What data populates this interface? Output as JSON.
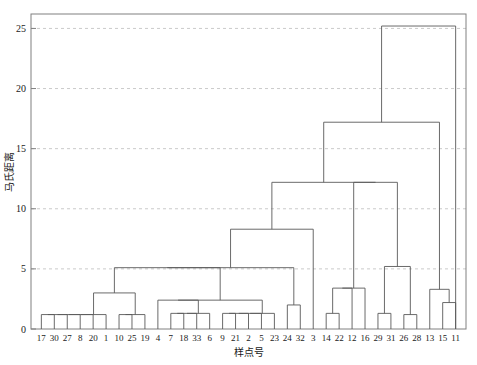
{
  "chart_data": {
    "type": "dendrogram",
    "title": "",
    "xlabel": "样点号",
    "ylabel": "马氏距离",
    "ylim": [
      0,
      26.2
    ],
    "yticks": [
      0,
      5,
      10,
      15,
      20,
      25
    ],
    "ytick_labels": [
      "0",
      "5",
      "10",
      "15",
      "20",
      "25"
    ],
    "grid": "horizontal-dashed",
    "legend": "none",
    "line_color": "#595959",
    "grid_color": "#bdbdbd",
    "axis_color": "#808080",
    "leaf_order": [
      "17",
      "30",
      "27",
      "8",
      "20",
      "1",
      "10",
      "25",
      "19",
      "4",
      "7",
      "18",
      "33",
      "6",
      "9",
      "21",
      "2",
      "5",
      "23",
      "24",
      "32",
      "3",
      "14",
      "22",
      "12",
      "16",
      "29",
      "31",
      "26",
      "28",
      "13",
      "15",
      "11"
    ],
    "n_leaves": 33,
    "links": [
      {
        "id": "L1",
        "left": {
          "leaf": "17"
        },
        "right": {
          "leaf": "30"
        },
        "height": 1.2
      },
      {
        "id": "L2",
        "left": {
          "node": "L1"
        },
        "right": {
          "leaf": "27"
        },
        "height": 1.2
      },
      {
        "id": "L3",
        "left": {
          "node": "L2"
        },
        "right": {
          "leaf": "8"
        },
        "height": 1.2
      },
      {
        "id": "L4",
        "left": {
          "node": "L3"
        },
        "right": {
          "leaf": "20"
        },
        "height": 1.2
      },
      {
        "id": "L5",
        "left": {
          "node": "L4"
        },
        "right": {
          "leaf": "1"
        },
        "height": 1.2
      },
      {
        "id": "L6",
        "left": {
          "leaf": "10"
        },
        "right": {
          "leaf": "25"
        },
        "height": 1.2
      },
      {
        "id": "L7",
        "left": {
          "node": "L6"
        },
        "right": {
          "leaf": "19"
        },
        "height": 1.2
      },
      {
        "id": "L8",
        "left": {
          "node": "L5"
        },
        "right": {
          "node": "L7"
        },
        "height": 3.0
      },
      {
        "id": "L9",
        "left": {
          "leaf": "7"
        },
        "right": {
          "leaf": "18"
        },
        "height": 1.3
      },
      {
        "id": "L10",
        "left": {
          "node": "L9"
        },
        "right": {
          "leaf": "33"
        },
        "height": 1.3
      },
      {
        "id": "L11",
        "left": {
          "node": "L10"
        },
        "right": {
          "leaf": "6"
        },
        "height": 1.3
      },
      {
        "id": "L12",
        "left": {
          "leaf": "4"
        },
        "right": {
          "node": "L11"
        },
        "height": 2.4
      },
      {
        "id": "L13",
        "left": {
          "leaf": "9"
        },
        "right": {
          "leaf": "21"
        },
        "height": 1.3
      },
      {
        "id": "L14",
        "left": {
          "node": "L13"
        },
        "right": {
          "leaf": "2"
        },
        "height": 1.3
      },
      {
        "id": "L15",
        "left": {
          "node": "L14"
        },
        "right": {
          "leaf": "5"
        },
        "height": 1.3
      },
      {
        "id": "L16",
        "left": {
          "node": "L15"
        },
        "right": {
          "leaf": "23"
        },
        "height": 1.3
      },
      {
        "id": "L17",
        "left": {
          "node": "L12"
        },
        "right": {
          "node": "L16"
        },
        "height": 2.4
      },
      {
        "id": "L18",
        "left": {
          "node": "L8"
        },
        "right": {
          "node": "L17"
        },
        "height": 5.1
      },
      {
        "id": "L19",
        "left": {
          "leaf": "24"
        },
        "right": {
          "leaf": "32"
        },
        "height": 2.0
      },
      {
        "id": "L20",
        "left": {
          "node": "L18"
        },
        "right": {
          "node": "L19"
        },
        "height": 5.1
      },
      {
        "id": "L21",
        "left": {
          "node": "L20"
        },
        "right": {
          "leaf": "3"
        },
        "height": 8.3
      },
      {
        "id": "L22",
        "left": {
          "leaf": "14"
        },
        "right": {
          "leaf": "22"
        },
        "height": 1.3
      },
      {
        "id": "L23",
        "left": {
          "node": "L22"
        },
        "right": {
          "leaf": "12"
        },
        "height": 3.4
      },
      {
        "id": "L24",
        "left": {
          "node": "L23"
        },
        "right": {
          "leaf": "16"
        },
        "height": 3.4
      },
      {
        "id": "L25",
        "left": {
          "leaf": "29"
        },
        "right": {
          "leaf": "31"
        },
        "height": 1.3
      },
      {
        "id": "L26",
        "left": {
          "leaf": "26"
        },
        "right": {
          "leaf": "28"
        },
        "height": 1.2
      },
      {
        "id": "L27",
        "left": {
          "node": "L25"
        },
        "right": {
          "node": "L26"
        },
        "height": 5.2
      },
      {
        "id": "L28",
        "left": {
          "node": "L24"
        },
        "right": {
          "node": "L27"
        },
        "height": 12.2
      },
      {
        "id": "L29",
        "left": {
          "node": "L21"
        },
        "right": {
          "node": "L28"
        },
        "height": 12.2
      },
      {
        "id": "L30",
        "left": {
          "leaf": "15"
        },
        "right": {
          "leaf": "11"
        },
        "height": 2.2
      },
      {
        "id": "L31",
        "left": {
          "leaf": "13"
        },
        "right": {
          "node": "L30"
        },
        "height": 3.3
      },
      {
        "id": "L32",
        "left": {
          "node": "L29"
        },
        "right": {
          "node": "L31"
        },
        "height": 17.2
      },
      {
        "id": "L33",
        "left": {
          "node": "L32"
        },
        "right": {
          "leaf": "11"
        },
        "height": 25.2
      }
    ]
  },
  "plot": {
    "y_axis_title": "马氏距离",
    "x_axis_title": "样点号"
  }
}
